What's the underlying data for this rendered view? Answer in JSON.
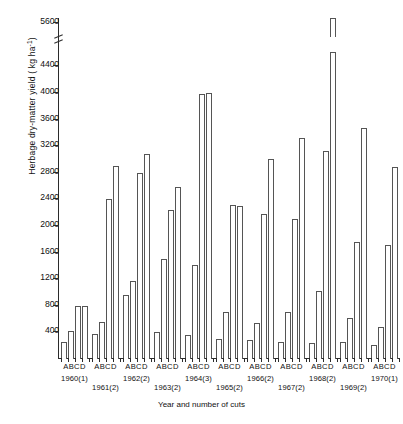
{
  "figure": {
    "xlabel": "Year and number of cuts",
    "ylabel_main": "Herbage dry-matter yield ( kg ha",
    "ylabel_exp": "-1",
    "ylabel_tail": ")"
  },
  "chart_data": {
    "type": "bar",
    "title": "",
    "xlabel": "Year and number of cuts",
    "ylabel": "Herbage dry-matter yield (kg ha^-1)",
    "ylim": [
      0,
      4600
    ],
    "axis_break": {
      "below": 4400,
      "above": 5600,
      "note": "y-axis broken between 4400 and 5600"
    },
    "yticks": [
      400,
      800,
      1200,
      1600,
      2000,
      2400,
      2800,
      3200,
      3600,
      4000,
      4400,
      5600
    ],
    "grid": false,
    "legend": "none",
    "treatment_labels": [
      "A",
      "B",
      "C",
      "D"
    ],
    "categories": [
      "1960(1)",
      "1961(2)",
      "1962(2)",
      "1963(2)",
      "1964(3)",
      "1965(2)",
      "1966(2)",
      "1967(2)",
      "1968(2)",
      "1969(2)",
      "1970(1)"
    ],
    "series": [
      {
        "name": "A",
        "values": [
          260,
          380,
          960,
          400,
          360,
          300,
          280,
          250,
          240,
          260,
          210
        ]
      },
      {
        "name": "B",
        "values": [
          420,
          560,
          1180,
          1500,
          1420,
          700,
          540,
          700,
          1020,
          620,
          480
        ]
      },
      {
        "name": "C",
        "values": [
          800,
          2400,
          2800,
          2240,
          3980,
          2320,
          2180,
          2100,
          3120,
          1760,
          1720
        ]
      },
      {
        "name": "D",
        "values": [
          800,
          2900,
          3080,
          2580,
          4000,
          2300,
          3000,
          3320,
          5500,
          3480,
          2880
        ]
      }
    ]
  },
  "ytick_labels": [
    "5600",
    "4400",
    "4000",
    "3600",
    "3200",
    "2800",
    "2400",
    "2000",
    "1600",
    "1200",
    "800",
    "400"
  ],
  "group_labels": [
    "ABCD",
    "ABCD",
    "ABCD",
    "ABCD",
    "ABCD",
    "ABCD",
    "ABCD",
    "ABCD",
    "ABCD",
    "ABCD",
    "ABCD"
  ],
  "year_labels": [
    "1960(1)",
    "1961(2)",
    "1962(2)",
    "1963(2)",
    "1964(3)",
    "1965(2)",
    "1966(2)",
    "1967(2)",
    "1968(2)",
    "1969(2)",
    "1970(1)"
  ]
}
